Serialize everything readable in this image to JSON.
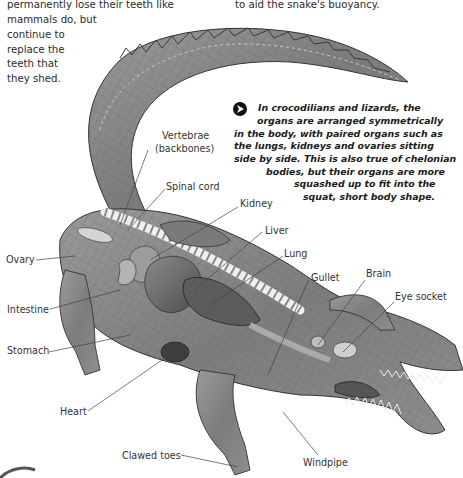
{
  "top_left_text": {
    "lines": [
      "permanently lose their teeth like",
      "mammals do, but",
      "continue to",
      "replace the",
      "teeth that",
      "they shed."
    ]
  },
  "top_right_text": {
    "lines": [
      "to aid the snake's buoyancy."
    ]
  },
  "callout": {
    "icon": "arrow-bullet-icon",
    "lines": [
      "In crocodilians and lizards, the",
      "organs are arranged symmetrically",
      "in the body, with paired organs such as",
      "the lungs, kidneys and ovaries sitting",
      "side by side. This is also true of chelonian",
      "bodies, but their organs are more",
      "squashed up to fit into the",
      "squat, short body shape."
    ]
  },
  "diagram": {
    "labels": [
      {
        "id": "vertebrae",
        "text": "Vertebrae",
        "text2": "(backbones)"
      },
      {
        "id": "spinal-cord",
        "text": "Spinal cord"
      },
      {
        "id": "kidney",
        "text": "Kidney"
      },
      {
        "id": "liver",
        "text": "Liver"
      },
      {
        "id": "lung",
        "text": "Lung"
      },
      {
        "id": "gullet",
        "text": "Gullet"
      },
      {
        "id": "brain",
        "text": "Brain"
      },
      {
        "id": "eye-socket",
        "text": "Eye socket"
      },
      {
        "id": "ovary",
        "text": "Ovary"
      },
      {
        "id": "intestine",
        "text": "Intestine"
      },
      {
        "id": "stomach",
        "text": "Stomach"
      },
      {
        "id": "heart",
        "text": "Heart"
      },
      {
        "id": "clawed-toes",
        "text": "Clawed toes"
      },
      {
        "id": "windpipe",
        "text": "Windpipe"
      }
    ]
  }
}
